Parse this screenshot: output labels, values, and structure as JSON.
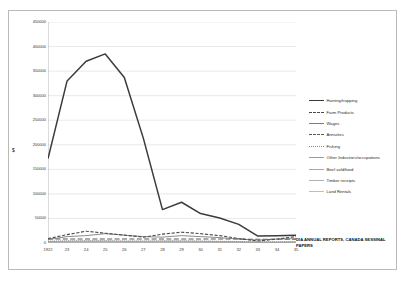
{
  "chart_data": {
    "type": "line",
    "title": "",
    "xlabel": "",
    "ylabel": "$",
    "ylim": [
      0,
      450000
    ],
    "ytick_values": [
      0,
      50000,
      100000,
      150000,
      200000,
      250000,
      300000,
      350000,
      400000,
      450000
    ],
    "ytick_labels": [
      "0",
      "50000",
      "100000",
      "150000",
      "200000",
      "250000",
      "300000",
      "350000",
      "400000",
      "450000"
    ],
    "categories": [
      "1922",
      "23",
      "24",
      "25",
      "26",
      "27",
      "28",
      "29",
      "30",
      "31",
      "32",
      "33",
      "34",
      "35"
    ],
    "grid": true,
    "legend_position": "right",
    "annotation": "DIA ANNUAL REPORTS, CANADA SESSINAL PAPERS",
    "series": [
      {
        "name": "Hunting/trapping",
        "style": "solid",
        "color": "#3b3b3b",
        "width": 1.5,
        "values": [
          172000,
          330000,
          370000,
          385000,
          337000,
          213000,
          68000,
          83000,
          60000,
          51000,
          38000,
          14000,
          15000,
          16000
        ]
      },
      {
        "name": "Farm Products",
        "style": "dashed",
        "color": "#4a4a4a",
        "width": 1.1,
        "values": [
          9000,
          17000,
          24000,
          20000,
          16000,
          12000,
          18000,
          22000,
          19000,
          15000,
          9000,
          4000,
          8000,
          13000
        ]
      },
      {
        "name": "Wages",
        "style": "solid",
        "color": "#7d7d7d",
        "width": 0.9,
        "values": [
          7000,
          13000,
          15000,
          19000,
          16000,
          13000,
          12000,
          15000,
          13000,
          11000,
          8000,
          6000,
          8000,
          9000
        ]
      },
      {
        "name": "Annuities",
        "style": "long-dash",
        "color": "#5a5a5a",
        "width": 1.1,
        "values": [
          8000,
          8000,
          8000,
          8000,
          8000,
          8000,
          8000,
          8000,
          8000,
          8000,
          8000,
          7500,
          7500,
          7500
        ]
      },
      {
        "name": "Fishing",
        "style": "dotted",
        "color": "#8c8c8c",
        "width": 0.9,
        "values": [
          4000,
          4500,
          4500,
          4500,
          4000,
          4000,
          4000,
          4000,
          4000,
          3500,
          3000,
          2500,
          2500,
          2500
        ]
      },
      {
        "name": "Other Industries/occupations",
        "style": "solid",
        "color": "#9a9a9a",
        "width": 0.8,
        "values": [
          3000,
          3500,
          4000,
          4000,
          3500,
          3500,
          4000,
          4000,
          3500,
          3000,
          2500,
          2000,
          2000,
          2500
        ]
      },
      {
        "name": "Beef sold/food",
        "style": "solid",
        "color": "#a8a8a8",
        "width": 0.8,
        "values": [
          2000,
          2200,
          2500,
          2500,
          2200,
          2000,
          2200,
          2200,
          2000,
          1800,
          1500,
          1200,
          1200,
          1500
        ]
      },
      {
        "name": "Timber receipts",
        "style": "solid",
        "color": "#b0b0b0",
        "width": 0.8,
        "values": [
          1200,
          1400,
          1500,
          1500,
          1400,
          1300,
          1400,
          1400,
          1200,
          1000,
          900,
          800,
          800,
          900
        ]
      },
      {
        "name": "Land Rentals",
        "style": "solid",
        "color": "#bdbdbd",
        "width": 0.8,
        "values": [
          600,
          700,
          800,
          800,
          700,
          650,
          700,
          700,
          600,
          500,
          450,
          400,
          400,
          450
        ]
      }
    ]
  }
}
